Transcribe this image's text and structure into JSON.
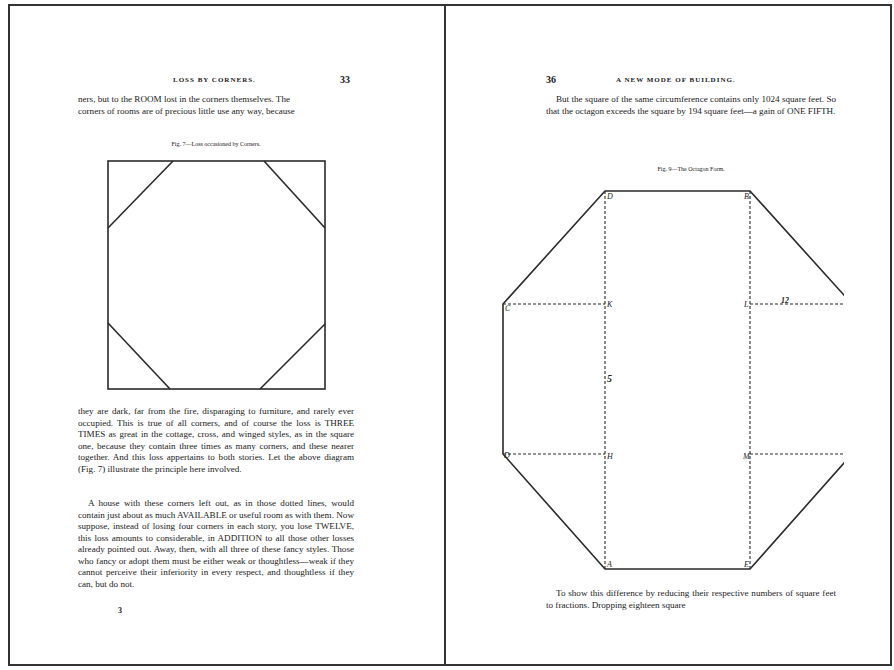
{
  "left_page": {
    "running_head": "LOSS BY CORNERS.",
    "page_number": "33",
    "intro_lines": [
      "ners, but to the ROOM lost in the corners themselves. The",
      "corners of rooms are of precious little use any way, because"
    ],
    "figure_caption": "Fig. 7—Loss occasioned by Corners.",
    "paragraph1": "they are dark, far from the fire, disparaging to furniture, and rarely ever occupied. This is true of all corners, and of course the loss is THREE TIMES as great in the cottage, cross, and winged styles, as in the square one, because they contain three times as many corners, and these nearer together. And this loss appertains to both stories. Let the above diagram (Fig. 7) illustrate the principle here involved.",
    "paragraph2": "A house with these corners left out, as in those dotted lines, would contain just about as much AVAILABLE or useful room as with them. Now suppose, instead of losing four corners in each story, you lose TWELVE, this loss amounts to considerable, in ADDITION to all those other losses already pointed out. Away, then, with all three of these fancy styles. Those who fancy or adopt them must be either weak or thoughtless—weak if they cannot perceive their inferiority in every respect, and thoughtless if they can, but do not.",
    "signature_mark": "3"
  },
  "right_page": {
    "page_number": "36",
    "running_head": "A NEW MODE OF BUILDING.",
    "paragraph1": "But the square of the same circumference contains only 1024 square feet. So that the octagon exceeds the square by 194 square feet—a gain of ONE FIFTH.",
    "figure_caption": "Fig. 9—The Octagon Form.",
    "figure_labels": {
      "top_left": "D",
      "top_right": "B",
      "left_upper": "C",
      "inner_upper_left": "K",
      "inner_upper_right": "L",
      "right_upper": "F",
      "dimension_upper": "12",
      "dimension_vertical": "5",
      "left_lower": "D",
      "inner_lower_left": "H",
      "inner_lower_right": "M",
      "right_lower": "G",
      "bottom_left": "A",
      "bottom_right": "E"
    },
    "paragraph2": "To show this difference by reducing their respective numbers of square feet to fractions. Dropping eighteen square"
  },
  "colors": {
    "paper": "#ffffff",
    "ink": "#1a1a1a",
    "border": "#333333"
  }
}
